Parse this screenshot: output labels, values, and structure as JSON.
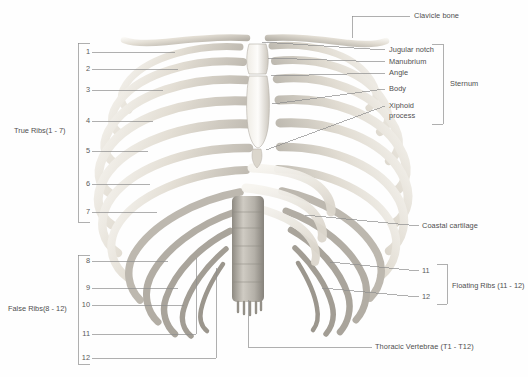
{
  "figure": {
    "background_color": "#fefefe",
    "line_color": "#8a8a8a",
    "text_color": "#4f4f4f",
    "bone_light": "#f2efe9",
    "bone_mid": "#d8d3c9",
    "bone_dark": "#9a968e",
    "spine_color": "#a8a49c"
  },
  "left_groups": {
    "true_ribs": {
      "label": "True Ribs(1 - 7)",
      "numbers": [
        "1",
        "2",
        "3",
        "4",
        "5",
        "6",
        "7"
      ]
    },
    "false_ribs": {
      "label": "False Ribs(8 - 12)",
      "numbers": [
        "8",
        "9",
        "10",
        "11",
        "12"
      ]
    }
  },
  "right_labels": {
    "clavicle": "Clavicle bone",
    "coastal_cartilage": "Coastal cartilage",
    "thoracic_vertebrae": "Thoracic Vertebrae (T1 - T12)",
    "floating_ribs": {
      "label": "Floating Ribs (11 - 12)",
      "numbers": [
        "11",
        "12"
      ]
    }
  },
  "sternum": {
    "group_label": "Sternum",
    "parts": [
      "Jugular notch",
      "Manubrium",
      "Angle",
      "Body",
      "Xiphoid",
      "process"
    ]
  }
}
